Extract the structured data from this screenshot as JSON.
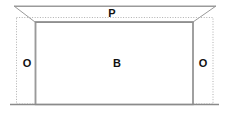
{
  "diagram": {
    "canvas": {
      "width": 229,
      "height": 114,
      "background": "#ffffff"
    },
    "colors": {
      "solid_line": "#9a9a9a",
      "dotted_line": "#b0b0b0",
      "heavy_line": "#8a8a8a",
      "label_text": "#111111",
      "fill": "#ffffff"
    },
    "labels": {
      "top": "P",
      "left": "O",
      "center": "B",
      "right": "O"
    },
    "shapes": {
      "outer_trapezoid": {
        "name": "outer-trapezoid",
        "points": "14,6 216,6 193,22 35,22"
      },
      "inner_rectangle": {
        "name": "inner-rectangle",
        "x": 35,
        "y": 22,
        "width": 158,
        "height": 82
      },
      "dotted_rectangle": {
        "name": "dotted-extent-rectangle",
        "x": 16.5,
        "y": 17.5,
        "width": 196.5,
        "height": 86.5
      },
      "baseline": {
        "name": "baseline",
        "x1": 10,
        "y1": 104.5,
        "x2": 219,
        "y2": 104.5
      },
      "top_edge": {
        "name": "top-edge",
        "x1": 14,
        "y1": 6.5,
        "x2": 216,
        "y2": 6.5
      },
      "left_diagonal": {
        "name": "left-diagonal",
        "x1": 14,
        "y1": 6,
        "x2": 35,
        "y2": 22
      },
      "right_diagonal": {
        "name": "right-diagonal",
        "x1": 216,
        "y1": 6,
        "x2": 193,
        "y2": 22
      }
    }
  }
}
